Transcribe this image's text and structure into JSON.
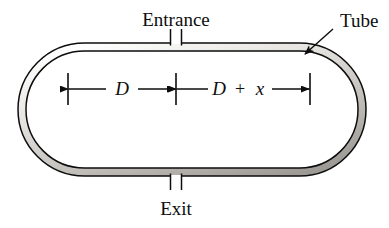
{
  "figure": {
    "background_color": "#ffffff",
    "ink_color": "#0d0d0d",
    "wall_fill_light": "#f2f1ef",
    "wall_fill_mid": "#c8c6c2",
    "wall_fill_dark": "#9b9894",
    "labels": {
      "entrance": "Entrance",
      "exit": "Exit",
      "tube": "Tube"
    },
    "dimensions": {
      "left_segment": "D",
      "right_segment_var": "D",
      "right_segment_op": "+",
      "right_segment_term": "x"
    },
    "geometry": {
      "tube_left": 18,
      "tube_right": 366,
      "tube_top": 43,
      "tube_bottom": 176,
      "wall_thickness": 8,
      "entrance_stub_x": 176,
      "exit_stub_x": 176,
      "dimension_line_y": 89,
      "tick_left_x": 68,
      "tick_mid_x": 176,
      "tick_right_x": 310
    }
  }
}
